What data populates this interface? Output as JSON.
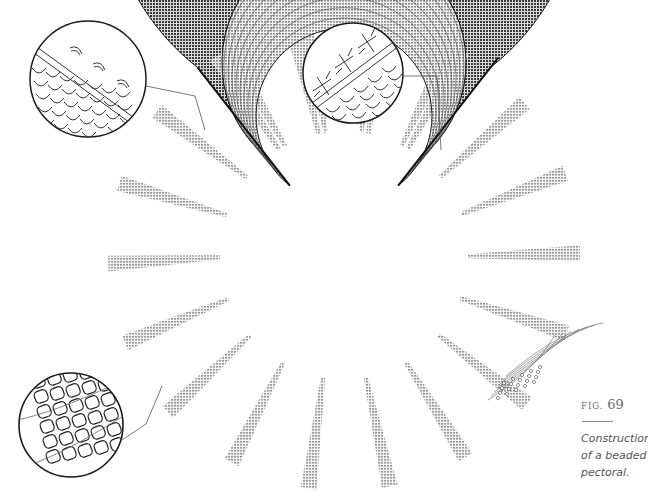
{
  "figure": {
    "label": "FIG.",
    "number": "69",
    "caption_lines": [
      "Construction",
      "of a beaded",
      "pectoral."
    ],
    "details": [
      {
        "id": "detail-top-left",
        "depicts": "edge with looped thread stitches over bead rows"
      },
      {
        "id": "detail-top-right",
        "depicts": "edge with cross-stitched ties over scale-like bead rows"
      },
      {
        "id": "detail-bottom-left",
        "depicts": "netted bead construction with threads"
      }
    ],
    "colors": {
      "ink": "#1a1a1a",
      "paper": "#ffffff",
      "caption": "#555555"
    }
  }
}
